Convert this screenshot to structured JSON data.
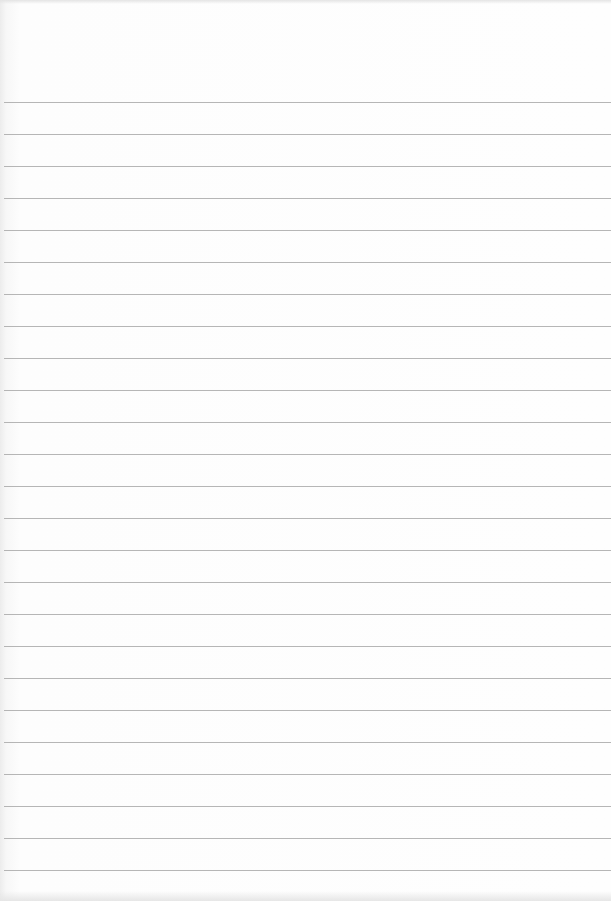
{
  "page": {
    "type": "blank lined paper",
    "background_color": "#fefefe",
    "rule_color": "#a9a9a9",
    "rule_count": 25,
    "first_rule_y": 102,
    "rule_spacing": 32
  }
}
